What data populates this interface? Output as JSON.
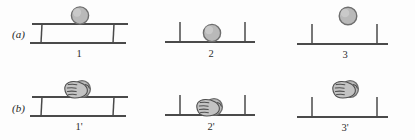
{
  "figure": {
    "background_color": "#fdfdfd",
    "line_color": "#4a4a4a",
    "ball_color": "#b9b9b9",
    "ball_outline_color": "#6e6e6e",
    "hand_color": "#c3c3c3",
    "hand_outline_color": "#4f4f4f"
  },
  "rows": [
    {
      "tag": "(a)",
      "description": "ball alone",
      "panels": [
        {
          "label": "1",
          "support": "bench",
          "ball_position": "resting on top rail",
          "hand": false
        },
        {
          "label": "2",
          "support": "line-with-ticks",
          "ball_position": "resting on line",
          "hand": false
        },
        {
          "label": "3",
          "support": "line-with-ticks",
          "ball_position": "above line, detached",
          "hand": false
        }
      ]
    },
    {
      "tag": "(b)",
      "description": "hand holding ball",
      "panels": [
        {
          "label": "1'",
          "support": "bench",
          "ball_position": "resting on top rail",
          "hand": true
        },
        {
          "label": "2'",
          "support": "line-with-ticks",
          "ball_position": "resting on line",
          "hand": true
        },
        {
          "label": "3'",
          "support": "line-with-ticks",
          "ball_position": "above line, detached",
          "hand": true
        }
      ]
    }
  ]
}
